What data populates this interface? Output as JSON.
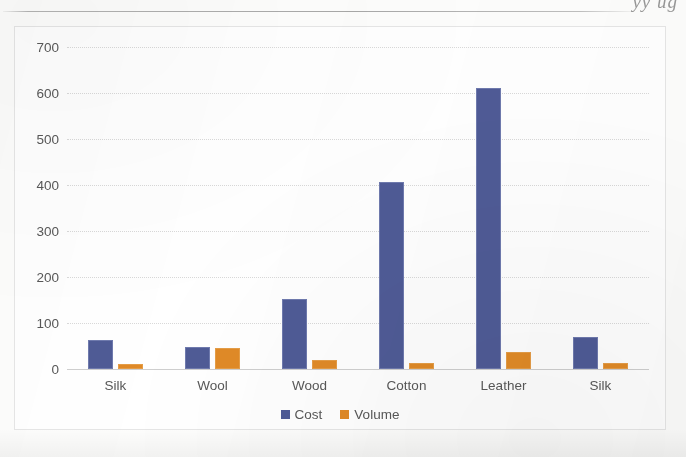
{
  "page": {
    "clipped_header_text": "yy ug",
    "rule_present": true
  },
  "chart_data": {
    "type": "bar",
    "title": "",
    "subtitle": "",
    "xlabel": "",
    "ylabel": "",
    "categories": [
      "Silk",
      "Wool",
      "Wood",
      "Cotton",
      "Leather",
      "Silk"
    ],
    "series": [
      {
        "name": "Cost",
        "color": "#4f5b96",
        "values": [
          62,
          48,
          153,
          407,
          610,
          70
        ]
      },
      {
        "name": "Volume",
        "color": "#e08a27",
        "values": [
          10,
          45,
          20,
          12,
          38,
          14
        ]
      }
    ],
    "ylim": [
      0,
      700
    ],
    "ytick_step": 100,
    "ytick_labels": [
      "0",
      "100",
      "200",
      "300",
      "400",
      "500",
      "600",
      "700"
    ],
    "grid": true,
    "grid_style": "dotted",
    "legend_position": "bottom-center",
    "legend_entries": [
      "Cost",
      "Volume"
    ],
    "plot_background": "#ffffff",
    "border_color": "#e6e6e6"
  }
}
